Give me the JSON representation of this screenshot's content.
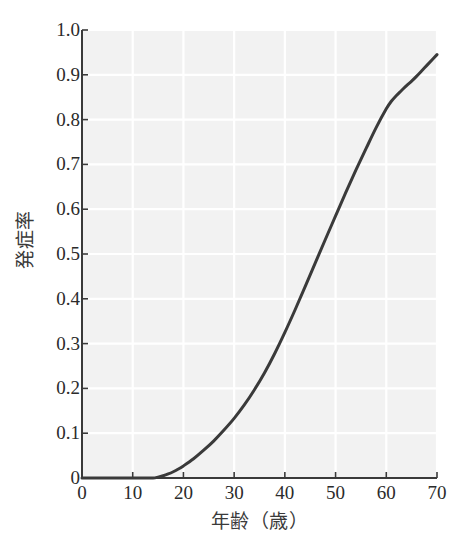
{
  "chart_data": {
    "type": "line",
    "title": "",
    "xlabel": "年齢（歳）",
    "ylabel": "発症率",
    "xlim": [
      0,
      70
    ],
    "ylim": [
      0,
      1.0
    ],
    "xticks": [
      0,
      10,
      20,
      30,
      40,
      50,
      60,
      70
    ],
    "yticks": [
      0,
      0.1,
      0.2,
      0.3,
      0.4,
      0.5,
      0.6,
      0.7,
      0.8,
      0.9,
      1.0
    ],
    "xtick_labels": [
      "0",
      "10",
      "20",
      "30",
      "40",
      "50",
      "60",
      "70"
    ],
    "ytick_labels": [
      "0",
      "0.1",
      "0.2",
      "0.3",
      "0.4",
      "0.5",
      "0.6",
      "0.7",
      "0.8",
      "0.9",
      "1.0"
    ],
    "grid": true,
    "legend": null,
    "series": [
      {
        "name": "発症率",
        "color": "#3a3a3a",
        "line_width": 3,
        "x": [
          0,
          5,
          10,
          12,
          14,
          15,
          16,
          17,
          18,
          19,
          20,
          22,
          24,
          26,
          28,
          30,
          32,
          34,
          36,
          38,
          40,
          42,
          44,
          46,
          48,
          50,
          52,
          54,
          56,
          58,
          60,
          61,
          62,
          63,
          64,
          65,
          66,
          67,
          68,
          69,
          70
        ],
        "y": [
          0.0,
          0.0,
          0.0,
          0.0,
          0.0,
          0.002,
          0.005,
          0.009,
          0.014,
          0.02,
          0.027,
          0.043,
          0.062,
          0.083,
          0.107,
          0.133,
          0.163,
          0.197,
          0.235,
          0.278,
          0.325,
          0.375,
          0.427,
          0.48,
          0.533,
          0.585,
          0.637,
          0.687,
          0.735,
          0.782,
          0.824,
          0.841,
          0.854,
          0.865,
          0.876,
          0.886,
          0.897,
          0.909,
          0.921,
          0.933,
          0.945
        ]
      }
    ]
  },
  "style": {
    "plot_background": "#f2f2f2",
    "grid_color": "#ffffff",
    "axis_color": "#3a3a3a",
    "curve_color": "#3a3a3a",
    "page_background": "#ffffff"
  },
  "geometry": {
    "plot_left": 82,
    "plot_right": 437,
    "plot_top": 30,
    "plot_bottom": 478
  }
}
